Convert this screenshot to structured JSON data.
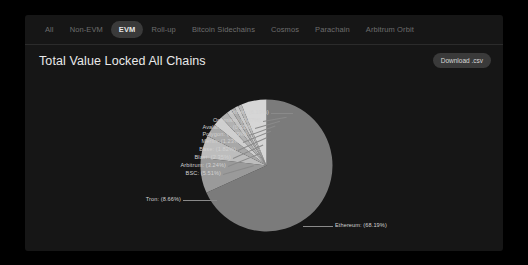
{
  "card": {
    "tabs": [
      {
        "label": "All",
        "active": false
      },
      {
        "label": "Non-EVM",
        "active": false
      },
      {
        "label": "EVM",
        "active": true
      },
      {
        "label": "Roll-up",
        "active": false
      },
      {
        "label": "Bitcoin Sidechains",
        "active": false
      },
      {
        "label": "Cosmos",
        "active": false
      },
      {
        "label": "Parachain",
        "active": false
      },
      {
        "label": "Arbitrum Orbit",
        "active": false
      }
    ],
    "title": "Total Value Locked All Chains",
    "download_label": "Download .csv"
  },
  "chart_data": {
    "type": "pie",
    "title": "Total Value Locked All Chains",
    "legend_position": "none",
    "label_format": "{name} ({value}%)",
    "categories": [
      "Ethereum",
      "Tron",
      "BSC",
      "Arbitrum",
      "Blast",
      "Base",
      "Merlin",
      "Polygon",
      "Avalanche",
      "Optimism",
      "Others"
    ],
    "values": [
      68.19,
      8.66,
      5.51,
      3.24,
      2.35,
      1.82,
      1.23,
      0.99,
      0.93,
      0.87,
      6.19
    ],
    "labels": [
      {
        "name": "Others",
        "value": 6.19,
        "text": "Others  (6.19%)"
      },
      {
        "name": "Optimism",
        "value": 0.87,
        "text": "Optimism: (0.87%)"
      },
      {
        "name": "Avalanche",
        "value": 0.93,
        "text": "Avalanche: (0.93%)"
      },
      {
        "name": "Polygon",
        "value": 0.99,
        "text": "Polygon: (0.99%)"
      },
      {
        "name": "Merlin",
        "value": 1.23,
        "text": "Merlin: (1.23%)"
      },
      {
        "name": "Base",
        "value": 1.82,
        "text": "Base: (1.82%)"
      },
      {
        "name": "Blast",
        "value": 2.35,
        "text": "Blast: (2.35%)"
      },
      {
        "name": "Arbitrum",
        "value": 3.24,
        "text": "Arbitrum: (3.24%)"
      },
      {
        "name": "BSC",
        "value": 5.51,
        "text": "BSC: (5.51%)"
      },
      {
        "name": "Tron",
        "value": 8.66,
        "text": "Tron: (8.66%)"
      },
      {
        "name": "Ethereum",
        "value": 68.19,
        "text": "Ethereum: (68.19%)"
      }
    ],
    "colors": {
      "Ethereum": "#7b7b7b",
      "Tron": "#9a9a9a",
      "BSC": "#bdbdbd",
      "Arbitrum": "#a8a8a8",
      "Blast": "#cfcfcf",
      "Base": "#b2b2b2",
      "Merlin": "#c4c4c4",
      "Polygon": "#adadad",
      "Avalanche": "#c9c9c9",
      "Optimism": "#b8b8b8",
      "Others": "#d6d6d6"
    }
  }
}
